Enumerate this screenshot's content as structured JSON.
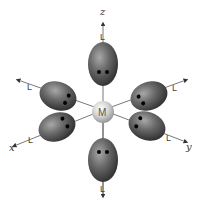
{
  "diagram": {
    "type": "octahedral-complex",
    "central_atom": {
      "label": "M"
    },
    "ligand_label": "L",
    "axes": {
      "z": "z",
      "x": "x",
      "y": "y"
    },
    "ligands": [
      {
        "position": "top",
        "axis": "+z",
        "label": "L",
        "electron_pair": 2
      },
      {
        "position": "upper-left",
        "axis": "-y",
        "label": "L",
        "electron_pair": 2
      },
      {
        "position": "upper-right",
        "axis": "-x",
        "label": "L",
        "electron_pair": 2
      },
      {
        "position": "lower-left",
        "axis": "+x",
        "label": "L",
        "electron_pair": 2
      },
      {
        "position": "lower-right",
        "axis": "+y",
        "label": "L",
        "electron_pair": 2
      },
      {
        "position": "bottom",
        "axis": "-z",
        "label": "L",
        "electron_pair": 2
      }
    ],
    "colors": {
      "lobe_dark": "#3a3a3a",
      "lobe_light": "#9a9a9a",
      "metal_light": "#f2f2f2",
      "metal_dark": "#9c9c9c",
      "axis_line": "#555555",
      "electron_dot": "#000000"
    }
  }
}
